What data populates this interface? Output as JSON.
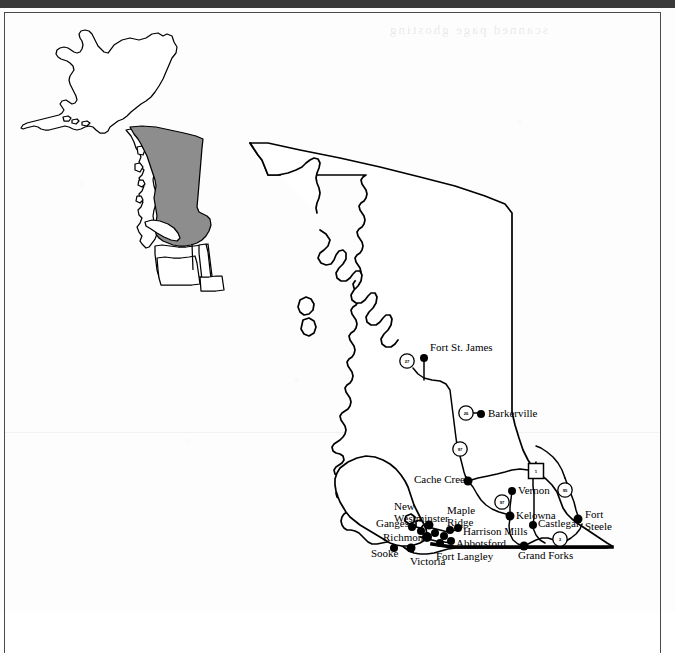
{
  "page": {
    "background_color": "#fdfdfd",
    "ink_color": "#000000",
    "highlight_color": "#8d8d8d",
    "frame_color": "#4a4a4a",
    "bleed_through_text": "scanned page ghosting"
  },
  "inset_map": {
    "name": "locator-inset",
    "description": "Alaska and Pacific Northwest locator with British Columbia shaded",
    "highlighted_region": "British Columbia",
    "highlight_color": "#8d8d8d"
  },
  "main_map": {
    "name": "british-columbia-map",
    "region": "British Columbia",
    "cities": [
      {
        "name": "Fort St. James",
        "label": "Fort St. James",
        "dot_x": 424,
        "dot_y": 358,
        "label_x": 430,
        "label_y": 342,
        "align": "left"
      },
      {
        "name": "Barkerville",
        "label": "Barkerville",
        "dot_x": 481,
        "dot_y": 414,
        "label_x": 488,
        "label_y": 408,
        "align": "left"
      },
      {
        "name": "Cache Creek",
        "label": "Cache Creek",
        "dot_x": 468,
        "dot_y": 481,
        "label_x": 414,
        "label_y": 474,
        "align": "left"
      },
      {
        "name": "Vernon",
        "label": "Vernon",
        "dot_x": 512,
        "dot_y": 491,
        "label_x": 518,
        "label_y": 486,
        "align": "left"
      },
      {
        "name": "Kelowna",
        "label": "Kelowna",
        "dot_x": 510,
        "dot_y": 516,
        "label_x": 516,
        "label_y": 511,
        "align": "left"
      },
      {
        "name": "Castlegar",
        "label": "Castlegar",
        "dot_x": 533,
        "dot_y": 525,
        "label_x": 539,
        "label_y": 518,
        "align": "left"
      },
      {
        "name": "Fort Steele",
        "label": "Fort\nSteele",
        "dot_x": 578,
        "dot_y": 519,
        "label_x": 585,
        "label_y": 508,
        "align": "left"
      },
      {
        "name": "Grand Forks",
        "label": "Grand Forks",
        "dot_x": 524,
        "dot_y": 546,
        "label_x": 519,
        "label_y": 549,
        "align": "left"
      },
      {
        "name": "Harrison Mills",
        "label": "Harrison Mills",
        "dot_x": 458,
        "dot_y": 528,
        "label_x": 464,
        "label_y": 527,
        "align": "left"
      },
      {
        "name": "Maple Ridge",
        "label": "Maple\nRidge",
        "dot_x": 450,
        "dot_y": 530,
        "label_x": 448,
        "label_y": 505,
        "align": "left"
      },
      {
        "name": "Abbotsford",
        "label": "Abbotsford",
        "dot_x": 451,
        "dot_y": 541,
        "label_x": 456,
        "label_y": 538,
        "align": "left"
      },
      {
        "name": "Fort Langley",
        "label": "Fort Langley",
        "dot_x": 440,
        "dot_y": 543,
        "label_x": 437,
        "label_y": 551,
        "align": "left"
      },
      {
        "name": "New Westminster",
        "label": "New\nWestminster",
        "dot_x": 429,
        "dot_y": 525,
        "label_x": 395,
        "label_y": 501,
        "align": "left"
      },
      {
        "name": "Richmond",
        "label": "Richmond",
        "dot_x": 427,
        "dot_y": 537,
        "label_x": 384,
        "label_y": 533,
        "align": "left"
      },
      {
        "name": "Ganges",
        "label": "Ganges",
        "dot_x": 412,
        "dot_y": 527,
        "label_x": 377,
        "label_y": 519,
        "align": "left"
      },
      {
        "name": "Victoria",
        "label": "Victoria",
        "dot_x": 411,
        "dot_y": 548,
        "label_x": 411,
        "label_y": 554,
        "align": "left"
      },
      {
        "name": "Sooke",
        "label": "Sooke",
        "dot_x": 394,
        "dot_y": 548,
        "label_x": 372,
        "label_y": 548,
        "align": "left"
      }
    ],
    "highway_shields": [
      {
        "type": "circle",
        "number": "27",
        "x": 407,
        "y": 361
      },
      {
        "type": "circle",
        "number": "26",
        "x": 466,
        "y": 413
      },
      {
        "type": "circle",
        "number": "97",
        "x": 460,
        "y": 449
      },
      {
        "type": "circle",
        "number": "97",
        "x": 502,
        "y": 502
      },
      {
        "type": "circle",
        "number": "95",
        "x": 565,
        "y": 490
      },
      {
        "type": "circle",
        "number": "3",
        "x": 560,
        "y": 539
      },
      {
        "type": "square",
        "number": "1",
        "x": 536,
        "y": 471
      }
    ]
  }
}
